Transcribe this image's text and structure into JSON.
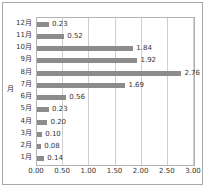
{
  "chart_data": {
    "type": "bar",
    "orientation": "horizontal",
    "title": "",
    "xlabel": "",
    "ylabel": "月",
    "categories": [
      "1月",
      "2月",
      "3月",
      "4月",
      "5月",
      "6月",
      "7月",
      "8月",
      "9月",
      "10月",
      "11月",
      "12月"
    ],
    "values": [
      0.14,
      0.08,
      0.1,
      0.2,
      0.23,
      0.56,
      1.69,
      2.76,
      1.92,
      1.84,
      0.52,
      0.23
    ],
    "data_labels": [
      "0.14",
      "0.08",
      "0.10",
      "0.20",
      "0.23",
      "0.56",
      "1.69",
      "2.76",
      "1.92",
      "1.84",
      "0.52",
      "0.23"
    ],
    "display_order_top_to_bottom": [
      "12月",
      "11月",
      "10月",
      "9月",
      "8月",
      "7月",
      "6月",
      "5月",
      "4月",
      "3月",
      "2月",
      "1月"
    ],
    "xlim": [
      0,
      3
    ],
    "xticks": [
      0,
      0.5,
      1,
      1.5,
      2,
      2.5,
      3
    ],
    "xtick_labels": [
      "0.00",
      "0.50",
      "1.00",
      "1.50",
      "2.00",
      "2.50",
      "3.00"
    ],
    "grid": "vertical",
    "legend": "none",
    "bar_color": "#8c8c8c",
    "gridline_color": "#cfcfcf",
    "border_color": "#a9a9a9"
  }
}
